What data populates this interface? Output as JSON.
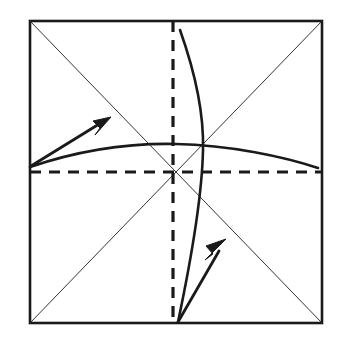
{
  "figure": {
    "type": "line-diagram",
    "background_color": "#ffffff",
    "ink_color": "#1a1a1a",
    "thin_line_color": "#333333",
    "canvas": {
      "width": 341,
      "height": 348
    }
  },
  "geometry": {
    "square": {
      "label": "paper-square",
      "left": 30,
      "top": 21,
      "right": 322,
      "bottom": 323,
      "stroke_width": 2.6,
      "stroke_color": "#1a1a1a",
      "fill": "none"
    },
    "diagonals": [
      {
        "label": "diagonal-tl-br",
        "x1": 30,
        "y1": 21,
        "x2": 322,
        "y2": 323,
        "stroke_width": 1.0,
        "stroke_color": "#333333",
        "dash": "none"
      },
      {
        "label": "diagonal-tr-bl",
        "x1": 322,
        "y1": 21,
        "x2": 30,
        "y2": 323,
        "stroke_width": 1.0,
        "stroke_color": "#333333",
        "dash": "none"
      }
    ],
    "fold_lines": [
      {
        "label": "horizontal-center-fold",
        "orientation": "horizontal",
        "x1": 30,
        "y1": 172,
        "x2": 322,
        "y2": 172,
        "stroke_width": 3.2,
        "stroke_color": "#1a1a1a",
        "dash": "11 8"
      },
      {
        "label": "vertical-center-fold",
        "orientation": "vertical",
        "x1": 173,
        "y1": 21,
        "x2": 173,
        "y2": 323,
        "stroke_width": 3.2,
        "stroke_color": "#1a1a1a",
        "dash": "11 8"
      }
    ],
    "curves": [
      {
        "label": "horizontal-arc-curve",
        "path": "M 30 167 C 80 150 130 143 176 144 C 230 145 285 157 318 168",
        "stroke_width": 2.6,
        "stroke_color": "#1a1a1a",
        "fill": "none"
      },
      {
        "label": "vertical-arc-curve",
        "path": "M 180 30 C 196 75 204 115 203 150 C 202 200 190 265 178 322",
        "stroke_width": 2.6,
        "stroke_color": "#1a1a1a",
        "fill": "none"
      }
    ],
    "arrows": [
      {
        "label": "upper-left-fold-arrow",
        "direction": "up-right",
        "tail_x": 31,
        "tail_y": 166,
        "tip_x": 111,
        "tip_y": 117,
        "shaft_path": "M 31 166 L 104 121",
        "head_points": "111,117 93,121 100,128 95,135",
        "stroke_width": 2.8,
        "stroke_color": "#1a1a1a"
      },
      {
        "label": "lower-right-fold-arrow",
        "direction": "up-right",
        "tail_x": 178,
        "tail_y": 322,
        "tip_x": 226,
        "tip_y": 239,
        "shaft_path": "M 178 322 L 219 251",
        "head_points": "226,239 206,246 213,254 205,260",
        "stroke_width": 2.8,
        "stroke_color": "#1a1a1a"
      }
    ]
  },
  "chart_data": {
    "type": "line",
    "xlabel": "",
    "ylabel": "",
    "elements": [
      "paper-square",
      "diagonal-tl-br",
      "diagonal-tr-bl",
      "horizontal-center-fold",
      "vertical-center-fold",
      "horizontal-arc-curve",
      "vertical-arc-curve",
      "upper-left-fold-arrow",
      "lower-right-fold-arrow"
    ]
  }
}
